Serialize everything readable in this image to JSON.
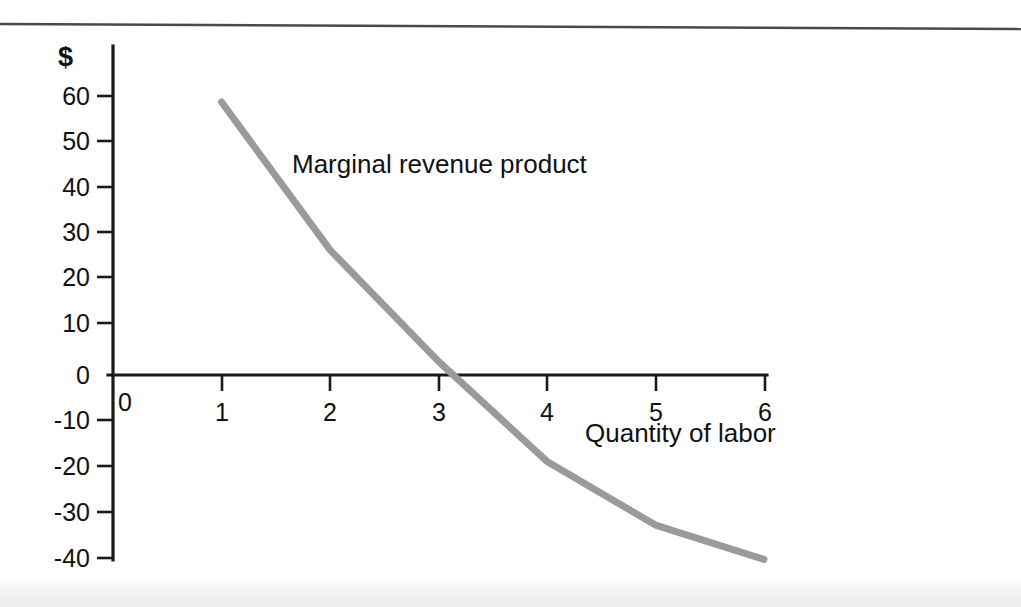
{
  "chart_data": {
    "type": "line",
    "title": "",
    "xlabel": "Quantity of labor",
    "ylabel": "$",
    "xlim": [
      0,
      6
    ],
    "ylim": [
      -40,
      60
    ],
    "grid": false,
    "legend_position": "inline-annotation",
    "x_ticks": [
      "0",
      "1",
      "2",
      "3",
      "4",
      "5",
      "6"
    ],
    "y_ticks": [
      "60",
      "50",
      "40",
      "30",
      "20",
      "10",
      "0",
      "-10",
      "-20",
      "-30",
      "-40"
    ],
    "series": [
      {
        "name": "Marginal revenue product",
        "x": [
          1,
          2,
          3,
          4,
          5,
          6
        ],
        "values": [
          60,
          27.5,
          3,
          -19,
          -33,
          -40.5
        ],
        "color": "#9a9a9a",
        "annotation": "Marginal revenue product",
        "zero_crossing_x": 3.1
      }
    ]
  },
  "labels": {
    "currency": "$",
    "origin": "0",
    "series_annotation": "Marginal revenue product",
    "x_axis_title": "Quantity of labor"
  },
  "colors": {
    "axis": "#1a1a1a",
    "series": "#9a9a9a",
    "background": "#ffffff"
  }
}
